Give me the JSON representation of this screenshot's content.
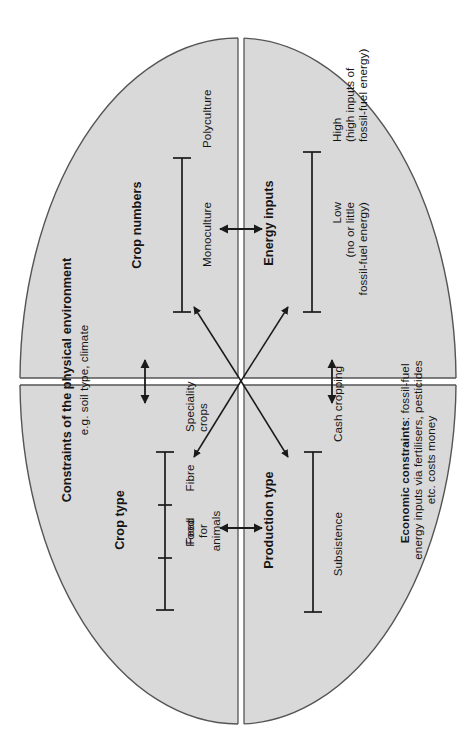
{
  "figure": {
    "kind": "conceptual-diagram",
    "orientation": "rotated-90-ccw",
    "shape": "ellipse-divided-into-four-quadrants",
    "fill_color": "#d9d9d9",
    "outline_color": "#4d4d4d",
    "line_color": "#1a1a1a"
  },
  "frame": {
    "title": "Constraints of the physical environment",
    "subtitle": "e.g. soil type, climate",
    "economic_title": "Economic constraints",
    "economic_body": ": fossil-fuel\nenergy inputs via fertilisers, pesticides\netc. costs money"
  },
  "axes": [
    {
      "id": "crop-numbers",
      "title": "Crop numbers",
      "quadrant": "top-left",
      "ticks": [
        "Monoculture",
        "Polyculture"
      ]
    },
    {
      "id": "energy-inputs",
      "title": "Energy inputs",
      "quadrant": "top-right",
      "ticks": [
        "Low\n(no or little\nfossil-fuel energy)",
        "High\n(high inputs of\nfossil-fuel energy)"
      ]
    },
    {
      "id": "crop-type",
      "title": "Crop type",
      "quadrant": "bottom-left",
      "ticks": [
        "Food",
        "Feed\nfor\nanimals",
        "Fibre",
        "Speciality\ncrops"
      ]
    },
    {
      "id": "production-type",
      "title": "Production type",
      "quadrant": "bottom-right",
      "ticks": [
        "Subsistence",
        "Cash cropping"
      ]
    }
  ],
  "connectors": {
    "centre_cross_arrows": 4,
    "top_divider_arrow": "double-headed",
    "right_divider_arrow": "double-headed",
    "left_divider_arrow": "double-headed",
    "bottom_divider_arrow": "double-headed"
  }
}
